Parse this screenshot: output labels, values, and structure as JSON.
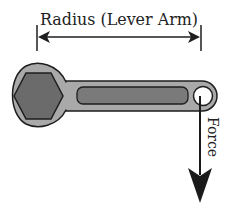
{
  "diagram": {
    "labels": {
      "radius": "Radius (Lever Arm)",
      "force": "Force"
    },
    "colors": {
      "background": "#ffffff",
      "outline": "#1e1e1e",
      "wrench_body": "#a9a9a9",
      "hex_nut": "#6b6b6b",
      "slot": "#7a7a7a",
      "arrow": "#1a1a1a"
    }
  }
}
